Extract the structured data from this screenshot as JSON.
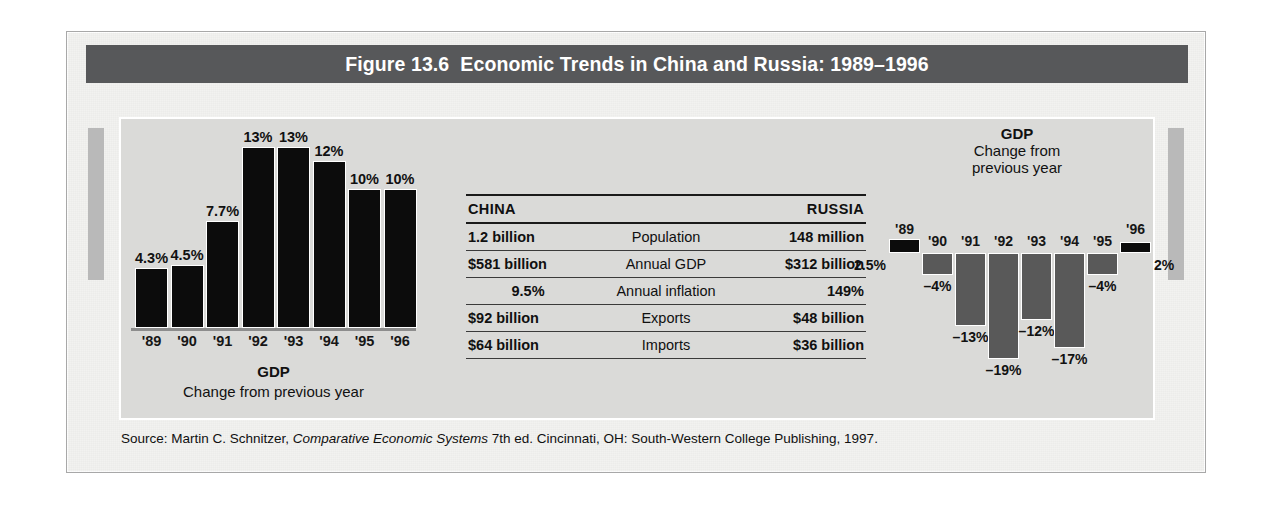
{
  "figure": {
    "title": "Figure 13.6  Economic Trends in China and Russia: 1989–1996",
    "source_prefix": "Source: Martin C. Schnitzer, ",
    "source_italic": "Comparative Economic Systems",
    "source_suffix": " 7th ed. Cincinnati, OH: South-Western College Publishing, 1997."
  },
  "colors": {
    "banner": "#57585a",
    "panel": "#dadad8",
    "frame": "#f2f2f0",
    "bar_positive": "#0c0c0c",
    "bar_negative": "#595959",
    "side_tab": "#b9b9b9"
  },
  "china_chart": {
    "caption_main": "GDP",
    "caption_sub": "Change from previous year"
  },
  "russia_chart": {
    "caption_main": "GDP",
    "caption_sub_1": "Change from",
    "caption_sub_2": "previous year"
  },
  "table": {
    "header": {
      "china": "CHINA",
      "label": "",
      "russia": "RUSSIA"
    },
    "rows": [
      {
        "china": "1.2 billion",
        "label": "Population",
        "russia": "148 million"
      },
      {
        "china": "$581 billion",
        "label": "Annual GDP",
        "russia": "$312 billion"
      },
      {
        "china": "9.5%",
        "label": "Annual inflation",
        "russia": "149%"
      },
      {
        "china": "$92 billion",
        "label": "Exports",
        "russia": "$48 billion"
      },
      {
        "china": "$64 billion",
        "label": "Imports",
        "russia": "$36 billion"
      }
    ]
  },
  "chart_data": [
    {
      "type": "bar",
      "id": "china-gdp",
      "title": "GDP",
      "subtitle": "Change from previous year",
      "region": "China",
      "xlabel": "",
      "ylabel": "Percent change from previous year",
      "categories": [
        "'89",
        "'90",
        "'91",
        "'92",
        "'93",
        "'94",
        "'95",
        "'96"
      ],
      "values": [
        4.3,
        4.5,
        7.7,
        13,
        13,
        12,
        10,
        10
      ],
      "value_labels": [
        "4.3%",
        "4.5%",
        "7.7%",
        "13%",
        "13%",
        "12%",
        "10%",
        "10%"
      ],
      "ylim": [
        0,
        14
      ],
      "grid": false,
      "legend": "none",
      "bar_color": "#0c0c0c"
    },
    {
      "type": "bar",
      "id": "russia-gdp",
      "title": "GDP",
      "subtitle": "Change from previous year",
      "region": "Russia",
      "xlabel": "",
      "ylabel": "Percent change from previous year",
      "categories": [
        "'89",
        "'90",
        "'91",
        "'92",
        "'93",
        "'94",
        "'95",
        "'96"
      ],
      "values": [
        2.5,
        -4,
        -13,
        -19,
        -12,
        -17,
        -4,
        2
      ],
      "value_labels": [
        "2.5%",
        "–4%",
        "–13%",
        "–19%",
        "–12%",
        "–17%",
        "–4%",
        "2%"
      ],
      "ylim": [
        -20,
        4
      ],
      "grid": false,
      "legend": "none",
      "bar_color_positive": "#0c0c0c",
      "bar_color_negative": "#595959"
    }
  ]
}
